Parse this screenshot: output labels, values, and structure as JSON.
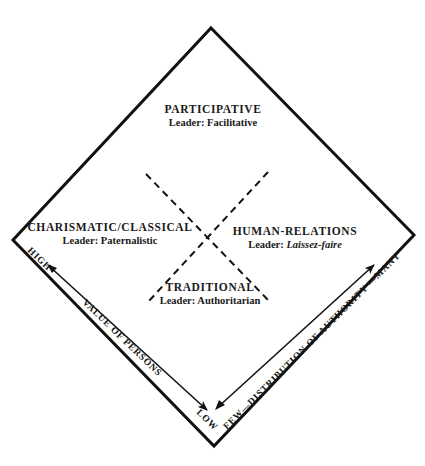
{
  "diagram": {
    "type": "diamond-quadrant",
    "quadrants": {
      "top": {
        "title": "PARTICIPATIVE",
        "leader_prefix": "Leader: ",
        "leader_style": "Facilitative"
      },
      "left": {
        "title": "CHARISMATIC/CLASSICAL",
        "leader_prefix": "Leader: ",
        "leader_style": "Paternalistic"
      },
      "right": {
        "title": "HUMAN-RELATIONS",
        "leader_prefix": "Leader: ",
        "leader_style": "Laissez-faire"
      },
      "bottom": {
        "title": "TRADITIONAL",
        "leader_prefix": "Leader: ",
        "leader_style": "Authoritarian"
      }
    },
    "axes": {
      "left": {
        "label": "VALUE OF PERSONS",
        "high": "HIGH",
        "low": "LOW"
      },
      "right": {
        "label": "FEW—DISTRIBUTION OF AUTHORITY —MANY"
      }
    },
    "colors": {
      "line": "#111111",
      "text": "#1a1a1a",
      "background": "#ffffff"
    }
  }
}
